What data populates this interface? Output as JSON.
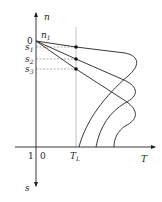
{
  "diagram": {
    "axes": {
      "vertical_up_label": "n",
      "vertical_down_label": "s",
      "horizontal_label": "T",
      "origin_top_label": "0",
      "origin_bottom_left_label": "1",
      "origin_bottom_right_label": "0"
    },
    "marker_labels": {
      "n1": "n",
      "n1_sub": "1",
      "s1": "s",
      "s1_sub": "1",
      "s2": "s",
      "s2_sub": "2",
      "s3": "s",
      "s3_sub": "3",
      "TL": "T",
      "TL_sub": "L"
    },
    "curves": [
      {
        "name": "curve-s1",
        "start": [
          36,
          41
        ],
        "dot": [
          76,
          47
        ]
      },
      {
        "name": "curve-s2",
        "start": [
          36,
          41
        ],
        "dot": [
          76,
          59
        ]
      },
      {
        "name": "curve-s3",
        "start": [
          36,
          41
        ],
        "dot": [
          76,
          69
        ]
      }
    ],
    "colors": {
      "line": "#222222",
      "dashed": "#666666",
      "guide": "#999999"
    }
  }
}
